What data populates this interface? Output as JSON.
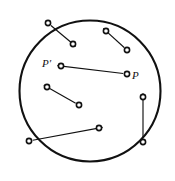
{
  "figure": {
    "name": "disk-with-displacement-vectors",
    "background_color": "#ffffff",
    "stroke_color": "#111111",
    "boundary": {
      "name": "disk-boundary-circle",
      "shape": "circle",
      "cx": 90,
      "cy": 91,
      "r": 70.5,
      "stroke_width": 2.1,
      "fill": "none"
    },
    "marker": {
      "shape": "small-open-circle",
      "radius": 2.6,
      "stroke_width": 1.6,
      "fill": "#ffffff"
    },
    "vectors": [
      {
        "id": "vector-top-left",
        "name": "arrow-top-left",
        "from": {
          "x": 48,
          "y": 23
        },
        "to": {
          "x": 73,
          "y": 44
        },
        "from_marker": true,
        "to_marker": true,
        "arrowhead_at": "to",
        "from_on_boundary": true
      },
      {
        "id": "vector-top-right",
        "name": "arrow-top-right",
        "from": {
          "x": 127,
          "y": 50
        },
        "to": {
          "x": 106,
          "y": 31
        },
        "from_marker": true,
        "to_marker": true,
        "arrowhead_at": "to",
        "from_on_boundary": false
      },
      {
        "id": "vector-p-to-p-prime",
        "name": "arrow-p-to-p-prime",
        "from": {
          "x": 127,
          "y": 74
        },
        "to": {
          "x": 61,
          "y": 66
        },
        "from_marker": true,
        "to_marker": true,
        "arrowhead_at": "to",
        "from_on_boundary": false,
        "from_label": "P",
        "to_label": "P′"
      },
      {
        "id": "vector-middle-left",
        "name": "arrow-middle-left",
        "from": {
          "x": 79,
          "y": 105
        },
        "to": {
          "x": 47,
          "y": 87
        },
        "from_marker": true,
        "to_marker": true,
        "arrowhead_at": "to",
        "from_on_boundary": false
      },
      {
        "id": "vector-bottom-left",
        "name": "arrow-bottom-left",
        "from": {
          "x": 29,
          "y": 141
        },
        "to": {
          "x": 99,
          "y": 128
        },
        "from_marker": true,
        "to_marker": true,
        "arrowhead_at": "to",
        "from_on_boundary": true
      },
      {
        "id": "vector-right-vertical",
        "name": "arrow-right-vertical",
        "from": {
          "x": 143,
          "y": 142
        },
        "to": {
          "x": 143,
          "y": 97
        },
        "from_marker": true,
        "to_marker": true,
        "arrowhead_at": "to",
        "from_on_boundary": false
      }
    ],
    "labels": [
      {
        "id": "label-p-prime",
        "name": "point-label-p-prime",
        "text": "P′",
        "x": 42,
        "y": 67
      },
      {
        "id": "label-p",
        "name": "point-label-p",
        "text": "P",
        "x": 132,
        "y": 79
      }
    ]
  }
}
